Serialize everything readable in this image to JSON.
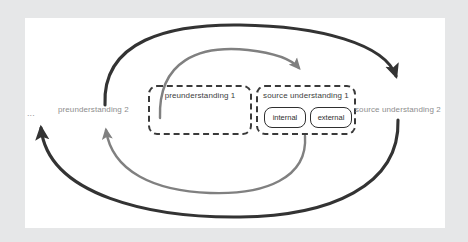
{
  "figure": {
    "type": "cycle-diagram",
    "background_color": "#e6e7e8",
    "canvas_color": "#ffffff"
  },
  "boxes": [
    {
      "id": "preunderstanding-1",
      "title": "preunderstanding 1",
      "style": "dashed",
      "children": []
    },
    {
      "id": "source-understanding-1",
      "title": "source understanding 1",
      "style": "dashed",
      "children": [
        {
          "id": "internal",
          "label": "internal",
          "style": "solid"
        },
        {
          "id": "external",
          "label": "external",
          "style": "solid"
        }
      ]
    }
  ],
  "labels": {
    "ellipsis": "...",
    "preunderstanding_2": "preunderstanding 2",
    "source_understanding_2": "source understanding 2"
  },
  "arrows": [
    {
      "id": "inner-forward",
      "color": "#808080",
      "from": "preunderstanding 1",
      "to": "source understanding 1",
      "direction": "clockwise-top"
    },
    {
      "id": "inner-return",
      "color": "#808080",
      "from": "source understanding 1",
      "to": "preunderstanding 2",
      "direction": "clockwise-bottom"
    },
    {
      "id": "outer-forward",
      "color": "#333333",
      "from": "preunderstanding 2",
      "to": "source understanding 2",
      "direction": "clockwise-top"
    },
    {
      "id": "outer-return",
      "color": "#333333",
      "from": "source understanding 2",
      "to": "...",
      "direction": "clockwise-bottom"
    }
  ],
  "colors": {
    "arc_dark": "#333333",
    "arc_grey": "#808080",
    "box_border": "#3a3a3a",
    "label_text": "#8d8d8d",
    "box_text": "#3d3d3d"
  }
}
